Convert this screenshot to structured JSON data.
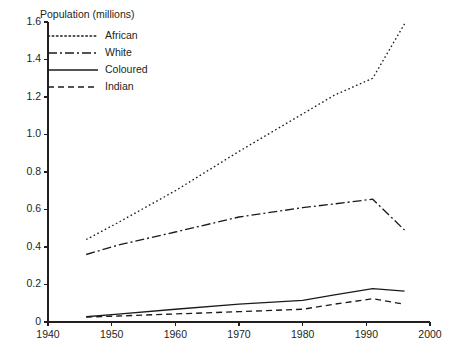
{
  "chart_data": {
    "type": "line",
    "title": "Population (millions)",
    "xlabel": "",
    "ylabel": "Population (millions)",
    "xlim": [
      1940,
      2000
    ],
    "ylim": [
      0,
      1.6
    ],
    "xticks": [
      1940,
      1950,
      1960,
      1970,
      1980,
      1990,
      2000
    ],
    "xticklabels": [
      "1940",
      "1950",
      "1960",
      "1970",
      "1980",
      "1990",
      "2000"
    ],
    "yticks": [
      0,
      0.2,
      0.4,
      0.6,
      0.8,
      1.0,
      1.2,
      1.4,
      1.6
    ],
    "yticklabels": [
      "0",
      "0.2",
      "0.4",
      "0.6",
      "0.8",
      "1.0",
      "1.2",
      "1.4",
      "1.6"
    ],
    "grid": false,
    "legend_position": "upper-left",
    "series": [
      {
        "name": "African",
        "style": "dotted",
        "dash": "1.6,2.6",
        "x": [
          1946,
          1951,
          1960,
          1970,
          1980,
          1985,
          1991,
          1996
        ],
        "y": [
          0.44,
          0.53,
          0.7,
          0.91,
          1.11,
          1.21,
          1.3,
          1.59
        ]
      },
      {
        "name": "White",
        "style": "dash-dot",
        "dash": "9,3,2,3",
        "x": [
          1946,
          1951,
          1960,
          1970,
          1980,
          1985,
          1991,
          1996
        ],
        "y": [
          0.36,
          0.41,
          0.48,
          0.56,
          0.61,
          0.63,
          0.655,
          0.49
        ]
      },
      {
        "name": "Coloured",
        "style": "solid",
        "dash": "",
        "x": [
          1946,
          1951,
          1960,
          1970,
          1980,
          1985,
          1991,
          1996
        ],
        "y": [
          0.028,
          0.042,
          0.068,
          0.095,
          0.115,
          0.145,
          0.178,
          0.165
        ]
      },
      {
        "name": "Indian",
        "style": "dashed",
        "dash": "6,4",
        "x": [
          1946,
          1951,
          1960,
          1970,
          1980,
          1985,
          1991,
          1996
        ],
        "y": [
          0.026,
          0.032,
          0.043,
          0.055,
          0.068,
          0.095,
          0.124,
          0.095
        ]
      }
    ],
    "legend_entries": [
      {
        "label": "African",
        "dash": "1.6,2.6"
      },
      {
        "label": "White",
        "dash": "9,3,2,3"
      },
      {
        "label": "Coloured",
        "dash": ""
      },
      {
        "label": "Indian",
        "dash": "6,4"
      }
    ],
    "colors": {
      "ink": "#231f20",
      "line": "#1b1b1b",
      "background": "#ffffff"
    }
  },
  "plot_geometry": {
    "left": 48,
    "right": 430,
    "top": 22,
    "bottom": 322,
    "tick_length": 4,
    "legend_x": 48,
    "legend_sample_width": 50,
    "legend_label_x": 105,
    "legend_y_start": 36,
    "legend_row_height": 17,
    "title_x": 40,
    "title_y": 18
  }
}
